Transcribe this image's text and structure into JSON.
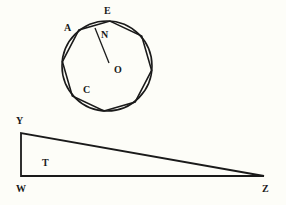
{
  "figure": {
    "circle_labels": {
      "A": "A",
      "E": "E",
      "N": "N",
      "O": "O",
      "C": "C"
    },
    "triangle_labels": {
      "Y": "Y",
      "T": "T",
      "W": "W",
      "Z": "Z"
    },
    "stroke_color": "#1a1a1a",
    "background": "#fdfdf8"
  }
}
